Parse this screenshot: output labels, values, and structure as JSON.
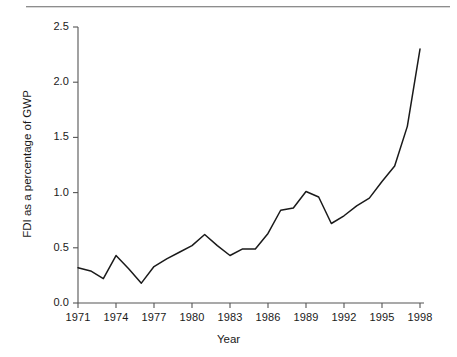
{
  "figure": {
    "has_top_rule": true,
    "background": "#ffffff",
    "line_color": "#1a1a1a",
    "axis_color": "#555555"
  },
  "chart_data": {
    "type": "line",
    "title": "",
    "xlabel": "Year",
    "ylabel": "FDI as a percentage of GWP",
    "xlim": [
      1971,
      1998
    ],
    "ylim": [
      0.0,
      2.5
    ],
    "grid": false,
    "legend": false,
    "xticks": [
      1971,
      1974,
      1977,
      1980,
      1983,
      1986,
      1989,
      1992,
      1995,
      1998
    ],
    "xticklabels": [
      "1971",
      "1974",
      "1977",
      "1980",
      "1983",
      "1986",
      "1989",
      "1992",
      "1995",
      "1998"
    ],
    "yticks": [
      0.0,
      0.5,
      1.0,
      1.5,
      2.0,
      2.5
    ],
    "yticklabels": [
      "0.0",
      "0.5",
      "1.0",
      "1.5",
      "2.0",
      "2.5"
    ],
    "x": [
      1971,
      1972,
      1973,
      1974,
      1975,
      1976,
      1977,
      1978,
      1979,
      1980,
      1981,
      1982,
      1983,
      1984,
      1985,
      1986,
      1987,
      1988,
      1989,
      1990,
      1991,
      1992,
      1993,
      1994,
      1995,
      1996,
      1997,
      1998
    ],
    "values": [
      0.32,
      0.29,
      0.22,
      0.43,
      0.31,
      0.18,
      0.33,
      0.4,
      0.46,
      0.52,
      0.62,
      0.52,
      0.43,
      0.49,
      0.49,
      0.63,
      0.84,
      0.86,
      1.01,
      0.96,
      0.72,
      0.79,
      0.88,
      0.95,
      1.1,
      1.24,
      1.6,
      2.3
    ],
    "series": [
      {
        "name": "FDI as a percentage of GWP",
        "values": [
          0.32,
          0.29,
          0.22,
          0.43,
          0.31,
          0.18,
          0.33,
          0.4,
          0.46,
          0.52,
          0.62,
          0.52,
          0.43,
          0.49,
          0.49,
          0.63,
          0.84,
          0.86,
          1.01,
          0.96,
          0.72,
          0.79,
          0.88,
          0.95,
          1.1,
          1.24,
          1.6,
          2.3
        ]
      }
    ]
  }
}
